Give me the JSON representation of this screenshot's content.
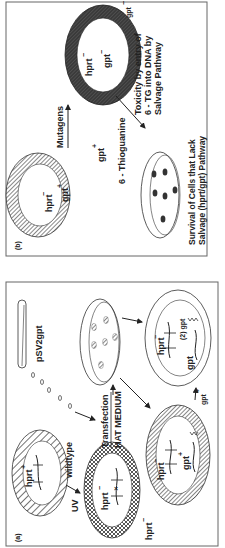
{
  "figure": {
    "orientation": "rotated-90-ccw",
    "panel_b": {
      "label": "(b)",
      "cell_top": {
        "hprt": "hprt",
        "hprt_sup": "−",
        "gpt": "gpt",
        "gpt_sup": "+"
      },
      "cell_mutant": {
        "hprt": "hprt",
        "hprt_sup": "−",
        "gpt": "gpt",
        "gpt_sup": "−"
      },
      "gpt_outer_top": "gpt",
      "gpt_outer_top_sup": "−",
      "gpt_outer_left": "gpt",
      "gpt_outer_left_sup": "+",
      "arrow_mutagens": "Mutagens",
      "drug": "6 - Thioguanine",
      "toxicity_line1": "Toxicity by entry of",
      "toxicity_line2": "6 - TG into DNA by",
      "toxicity_line3": "Salvage Pathway",
      "survival_line1": "Survival of Cells that Lack",
      "survival_line2": "Salvage (hprt/gpt) Pathway"
    },
    "panel_a": {
      "label": "(a)",
      "cell_wildtype": {
        "hprt": "hprt",
        "hprt_sup": "+",
        "tag": "wildtype"
      },
      "uv": "UV",
      "cell_uv": {
        "hprt": "hprt",
        "hprt_sup": "−"
      },
      "hprt_minus_outer": "hprt",
      "hprt_minus_outer_sup": "−",
      "transfection_line1": "Transfection",
      "transfection_line2": "HAT MEDIUM",
      "plasmid": "pSV2gpt",
      "cell_transfected": {
        "hprt": "hprt",
        "hprt_sup": "−",
        "gpt": "gpt",
        "gpt_sup": "+"
      },
      "cell_double": {
        "hprt": "hprt",
        "hprt_sup": "−",
        "gpt": "gpt",
        "two_gpt": "(2) gpt"
      },
      "gpt_arrow": "gpt",
      "gpt_arrow_sup": "+"
    }
  },
  "colors": {
    "ink": "#222222",
    "frame": "#666666",
    "hatch": "#555555",
    "dark_ring": "#3a3a3a",
    "background": "#ffffff"
  }
}
